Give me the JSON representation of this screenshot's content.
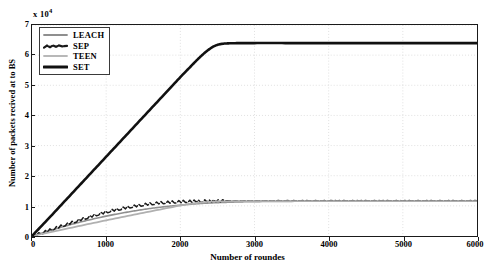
{
  "chart_data": {
    "type": "line",
    "title": "",
    "xlabel": "Number of roundes",
    "ylabel": "Number of packets recived at to BS",
    "y_exponent_label": "x 10",
    "y_exponent_power": "4",
    "xlim": [
      0,
      6000
    ],
    "ylim": [
      0,
      70000
    ],
    "xticks": [
      0,
      1000,
      2000,
      3000,
      4000,
      5000,
      6000
    ],
    "xticklabels": [
      "0",
      "1000",
      "2000",
      "3000",
      "4000",
      "5000",
      "6000"
    ],
    "yticks": [
      0,
      10000,
      20000,
      30000,
      40000,
      50000,
      60000,
      70000
    ],
    "yticklabels": [
      "0",
      "1",
      "2",
      "3",
      "4",
      "5",
      "6",
      "7"
    ],
    "grid": true,
    "grid_style": "dotted",
    "legend_position": "upper-left",
    "series": [
      {
        "name": "LEACH",
        "color": "#8f8f8f",
        "style": "solid",
        "width": 1.6,
        "x": [
          0,
          200,
          400,
          600,
          800,
          1000,
          1200,
          1400,
          1600,
          1800,
          2000,
          2200,
          2400,
          2600,
          2800,
          3000,
          3500,
          4000,
          4500,
          5000,
          5500,
          6000
        ],
        "y": [
          0,
          1500,
          2950,
          4300,
          5500,
          6600,
          7550,
          8400,
          9150,
          9750,
          10250,
          10650,
          10950,
          11150,
          11300,
          11400,
          11500,
          11520,
          11530,
          11540,
          11545,
          11550
        ]
      },
      {
        "name": "SEP",
        "color": "#1a1a1a",
        "style": "dashed-jagged",
        "width": 1.5,
        "x": [
          0,
          150,
          300,
          450,
          600,
          750,
          900,
          1050,
          1200,
          1350,
          1500,
          1650,
          1800,
          1950,
          2100,
          2300,
          2600,
          3000,
          3500,
          4000,
          5000,
          6000
        ],
        "y": [
          0,
          1200,
          2500,
          3800,
          5000,
          6200,
          7300,
          8300,
          9100,
          9800,
          10400,
          10850,
          11150,
          11350,
          11500,
          11600,
          11650,
          11680,
          11700,
          11700,
          11700,
          11700
        ]
      },
      {
        "name": "TEEN",
        "color": "#b0b0b0",
        "style": "solid",
        "width": 1.8,
        "x": [
          0,
          500,
          1000,
          1500,
          2000,
          2200,
          2400,
          2600,
          3000,
          3500,
          4000,
          4500,
          5000,
          5500,
          6000
        ],
        "y": [
          0,
          2600,
          5200,
          7700,
          10100,
          10900,
          11350,
          11500,
          11570,
          11590,
          11600,
          11600,
          11600,
          11600,
          11600
        ]
      },
      {
        "name": "SET",
        "color": "#111111",
        "style": "solid",
        "width": 2.6,
        "x": [
          0,
          250,
          500,
          750,
          1000,
          1250,
          1500,
          1750,
          2000,
          2150,
          2250,
          2350,
          2450,
          2550,
          2700,
          3000,
          3500,
          4000,
          4500,
          5000,
          5500,
          6000
        ],
        "y": [
          0,
          6500,
          13100,
          19700,
          26300,
          32900,
          39500,
          46100,
          52700,
          56500,
          59000,
          61200,
          62900,
          63700,
          63950,
          64000,
          64000,
          64000,
          64000,
          64000,
          64000,
          64000
        ]
      }
    ],
    "legend_entries": [
      {
        "label": "LEACH",
        "color": "#8f8f8f",
        "style": "solid",
        "width": 1.8
      },
      {
        "label": "SEP",
        "color": "#1a1a1a",
        "style": "dashed-jagged",
        "width": 2.2
      },
      {
        "label": "TEEN",
        "color": "#b8b8b8",
        "style": "solid",
        "width": 1.8
      },
      {
        "label": "SET",
        "color": "#111111",
        "style": "solid",
        "width": 3.2
      }
    ]
  }
}
